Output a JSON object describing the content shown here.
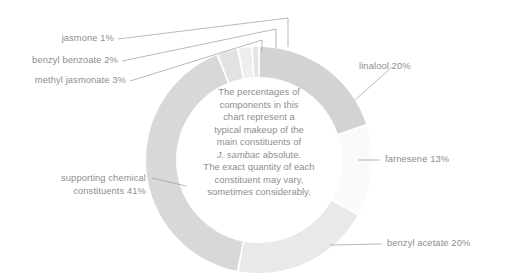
{
  "chart_data": {
    "type": "pie",
    "variant": "donut",
    "title": "",
    "subtitle": "",
    "xlabel": "",
    "ylabel": "",
    "units": "percent",
    "legend_position": "callout-labels",
    "grid": false,
    "total": 100,
    "start_angle_deg": 0,
    "direction": "clockwise",
    "categories": [
      "linalool",
      "farnesene",
      "benzyl acetate",
      "supporting chemical constituents",
      "methyl jasmonate",
      "benzyl benzoate",
      "jasmone"
    ],
    "values": [
      20,
      13,
      20,
      41,
      3,
      2,
      1
    ],
    "slices": [
      {
        "label": "linalool",
        "value": 20,
        "display": "linalool 20%",
        "color": "#d3d3d3"
      },
      {
        "label": "farnesene",
        "value": 13,
        "display": "farnesene 13%",
        "color": "#fafafa"
      },
      {
        "label": "benzyl acetate",
        "value": 20,
        "display": "benzyl acetate 20%",
        "color": "#e9e9e9"
      },
      {
        "label": "supporting chemical constituents",
        "value": 41,
        "display": "supporting chemical constituents 41%",
        "color": "#d8d8d8"
      },
      {
        "label": "methyl jasmonate",
        "value": 3,
        "display": "methyl jasmonate 3%",
        "color": "#e2e2e2"
      },
      {
        "label": "benzyl benzoate",
        "value": 2,
        "display": "benzyl benzoate 2%",
        "color": "#eeeeee"
      },
      {
        "label": "jasmone",
        "value": 1,
        "display": "jasmone 1%",
        "color": "#e4e4e4"
      }
    ]
  },
  "labels": {
    "jasmone": "jasmone 1%",
    "benzyl_benzoate": "benzyl benzoate 2%",
    "methyl_jasmonate": "methyl jasmonate 3%",
    "linalool": "linalool 20%",
    "farnesene": "farnesene 13%",
    "benzyl_acetate": "benzyl acetate 20%",
    "supporting_line1": "supporting chemical",
    "supporting_line2": "constituents 41%"
  },
  "center_note": {
    "line1": "The percentages of",
    "line2": "components in this",
    "line3": "chart represent a",
    "line4": "typical makeup of the",
    "line5": "main constituents of",
    "line6_italic": "J. sambac",
    "line6_rest": " absolute.",
    "line7": "The exact quantity of each",
    "line8": "constituent may vary,",
    "line9": "sometimes considerably."
  },
  "colors": {
    "text": "#8d8d8d",
    "leader": "#9a9a9a",
    "background": "#ffffff"
  }
}
